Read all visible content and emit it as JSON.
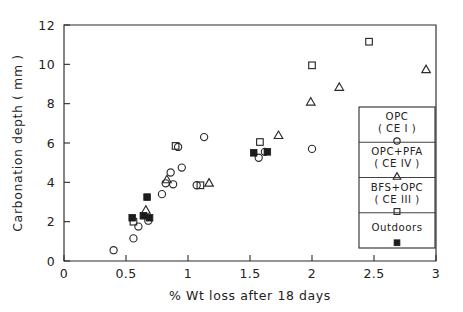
{
  "chart_data": {
    "type": "scatter",
    "title": "",
    "xlabel": "% Wt loss after 18 days",
    "ylabel": "Carbonation depth ( mm )",
    "xlim": [
      0,
      3
    ],
    "ylim": [
      0,
      12
    ],
    "xticks": [
      "0",
      "0.5",
      "1",
      "1.5",
      "2",
      "2.5",
      "3"
    ],
    "xtick_values": [
      0,
      0.5,
      1,
      1.5,
      2,
      2.5,
      3
    ],
    "yticks": [
      "0",
      "2",
      "4",
      "6",
      "8",
      "10",
      "12"
    ],
    "ytick_values": [
      0,
      2,
      4,
      6,
      8,
      10,
      12
    ],
    "grid": false,
    "legend_position": "lower-right-inside",
    "series": [
      {
        "name": "OPC ( CE I )",
        "marker": "circle-open",
        "points": [
          [
            0.4,
            0.55
          ],
          [
            0.56,
            1.15
          ],
          [
            0.6,
            1.75
          ],
          [
            0.68,
            2.05
          ],
          [
            0.79,
            3.4
          ],
          [
            0.82,
            3.95
          ],
          [
            0.86,
            4.5
          ],
          [
            0.92,
            5.8
          ],
          [
            0.88,
            3.9
          ],
          [
            0.95,
            4.75
          ],
          [
            1.07,
            3.85
          ],
          [
            1.13,
            6.3
          ],
          [
            1.57,
            5.25
          ],
          [
            1.62,
            5.55
          ],
          [
            2.0,
            5.7
          ]
        ]
      },
      {
        "name": "OPC+PFA ( CE IV )",
        "marker": "triangle-open",
        "points": [
          [
            0.66,
            2.6
          ],
          [
            0.83,
            4.15
          ],
          [
            1.17,
            3.98
          ],
          [
            1.73,
            6.4
          ],
          [
            1.99,
            8.1
          ],
          [
            2.22,
            8.85
          ],
          [
            2.92,
            9.75
          ]
        ]
      },
      {
        "name": "BFS+OPC ( CE III )",
        "marker": "square-open",
        "points": [
          [
            0.56,
            2.0
          ],
          [
            0.9,
            5.85
          ],
          [
            1.1,
            3.85
          ],
          [
            1.58,
            6.05
          ],
          [
            2.0,
            9.95
          ],
          [
            2.46,
            11.15
          ]
        ]
      },
      {
        "name": "Outdoors",
        "marker": "square-filled",
        "points": [
          [
            0.55,
            2.2
          ],
          [
            0.64,
            2.3
          ],
          [
            0.69,
            2.2
          ],
          [
            0.67,
            3.25
          ],
          [
            1.53,
            5.5
          ],
          [
            1.64,
            5.55
          ]
        ]
      }
    ]
  },
  "legend": {
    "entries": [
      {
        "label_line1": "OPC",
        "label_line2": "( CE I )",
        "marker": "circle-open"
      },
      {
        "label_line1": "OPC+PFA",
        "label_line2": "( CE IV )",
        "marker": "triangle-open"
      },
      {
        "label_line1": "BFS+OPC",
        "label_line2": "( CE III )",
        "marker": "square-open"
      },
      {
        "label_line1": "Outdoors",
        "label_line2": "",
        "marker": "square-filled"
      }
    ]
  },
  "colors": {
    "axis": "#2b2b2b",
    "marker_open": "#2b2b2b",
    "marker_filled": "#1c1c1c",
    "background": "#ffffff"
  }
}
